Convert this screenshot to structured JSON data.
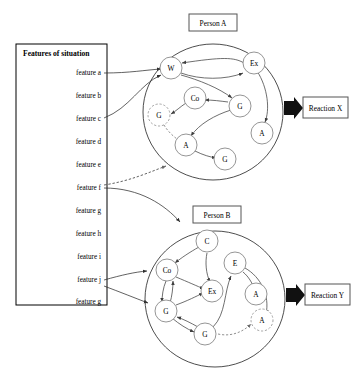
{
  "diagram": {
    "type": "cognitive-network-diagram",
    "features_panel": {
      "title": "Features of situation",
      "items": [
        {
          "id": "a",
          "label": "feature a"
        },
        {
          "id": "b",
          "label": "feature b"
        },
        {
          "id": "c",
          "label": "feature c"
        },
        {
          "id": "d",
          "label": "feature d"
        },
        {
          "id": "e",
          "label": "feature e"
        },
        {
          "id": "f",
          "label": "feature f"
        },
        {
          "id": "g",
          "label": "feature g"
        },
        {
          "id": "h",
          "label": "feature h"
        },
        {
          "id": "i",
          "label": "feature i"
        },
        {
          "id": "j",
          "label": "feature j"
        },
        {
          "id": "g2",
          "label": "feature g"
        }
      ]
    },
    "persons": [
      {
        "id": "person-a",
        "label": "Person A",
        "reaction": "Reaction X",
        "nodes": [
          {
            "id": "a-w",
            "label": "W",
            "style": "solid"
          },
          {
            "id": "a-ex",
            "label": "Ex",
            "style": "solid"
          },
          {
            "id": "a-co",
            "label": "Co",
            "style": "solid"
          },
          {
            "id": "a-g1",
            "label": "G",
            "style": "solid"
          },
          {
            "id": "a-g2",
            "label": "G",
            "style": "dashed"
          },
          {
            "id": "a-a1",
            "label": "A",
            "style": "solid"
          },
          {
            "id": "a-a2",
            "label": "A",
            "style": "solid"
          },
          {
            "id": "a-g3",
            "label": "G",
            "style": "solid"
          }
        ]
      },
      {
        "id": "person-b",
        "label": "Person B",
        "reaction": "Reaction Y",
        "nodes": [
          {
            "id": "b-c",
            "label": "C",
            "style": "solid"
          },
          {
            "id": "b-e",
            "label": "E",
            "style": "solid"
          },
          {
            "id": "b-co",
            "label": "Co",
            "style": "solid"
          },
          {
            "id": "b-ex",
            "label": "Ex",
            "style": "solid"
          },
          {
            "id": "b-a1",
            "label": "A",
            "style": "solid"
          },
          {
            "id": "b-a2",
            "label": "A",
            "style": "dashed"
          },
          {
            "id": "b-g1",
            "label": "G",
            "style": "solid"
          },
          {
            "id": "b-g2",
            "label": "G",
            "style": "solid"
          }
        ]
      }
    ],
    "colors": {
      "stroke": "#3f3f3f",
      "node_stroke": "#7a7a7a",
      "panel_stroke": "#000000",
      "arrow_fill": "#111111",
      "background": "#ffffff"
    }
  }
}
